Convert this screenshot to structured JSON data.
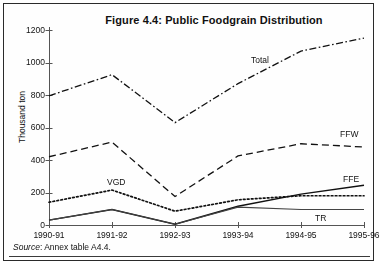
{
  "figure": {
    "title": "Figure 4.4: Public Foodgrain Distribution",
    "source_prefix": "Source",
    "source_text": ": Annex table A4.4.",
    "frame_color": "#2a2a2a",
    "background": "#ffffff"
  },
  "chart_data": {
    "type": "line",
    "title": "Figure 4.4: Public Foodgrain Distribution",
    "xlabel": "",
    "ylabel": "Thousand ton",
    "categories": [
      "1990-91",
      "1991-92",
      "1992-93",
      "1993-94",
      "1994-95",
      "1995-96"
    ],
    "ylim": [
      0,
      1200
    ],
    "yticks": [
      0,
      200,
      400,
      600,
      800,
      1000,
      1200
    ],
    "grid": false,
    "legend": "inline-annotations",
    "series": [
      {
        "name": "Total",
        "label": "Total",
        "style": "dash-dot",
        "color": "#111111",
        "values": [
          795,
          925,
          630,
          870,
          1070,
          1150
        ]
      },
      {
        "name": "FFW",
        "label": "FFW",
        "style": "dashed",
        "color": "#111111",
        "values": [
          420,
          510,
          175,
          425,
          500,
          480
        ]
      },
      {
        "name": "VGD",
        "label": "VGD",
        "style": "dotted",
        "color": "#111111",
        "values": [
          140,
          215,
          85,
          155,
          180,
          180
        ]
      },
      {
        "name": "FFE",
        "label": "FFE",
        "style": "solid",
        "color": "#111111",
        "values": [
          30,
          95,
          5,
          115,
          190,
          245
        ]
      },
      {
        "name": "TR",
        "label": "TR",
        "style": "solid-thin",
        "color": "#444444",
        "values": [
          30,
          95,
          5,
          110,
          95,
          95
        ]
      }
    ],
    "annotations": [
      {
        "text": "Total",
        "x_px": 247,
        "y_px": 52
      },
      {
        "text": "FFW",
        "x_px": 336,
        "y_px": 126
      },
      {
        "text": "FFE",
        "x_px": 339,
        "y_px": 171
      },
      {
        "text": "VGD",
        "x_px": 103,
        "y_px": 174
      },
      {
        "text": "TR",
        "x_px": 311,
        "y_px": 210
      }
    ]
  }
}
